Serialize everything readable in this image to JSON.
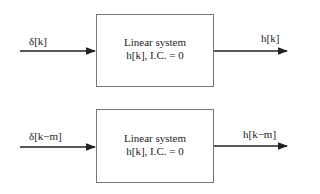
{
  "diagrams": [
    {
      "input_label": "δ[k]",
      "box_line1": "Linear system",
      "box_line2": "h[k], I.C. = 0",
      "output_label": "h[k]"
    },
    {
      "input_label": "δ[k−m]",
      "box_line1": "Linear system",
      "box_line2": "h[k], I.C. = 0",
      "output_label": "h[k−m]"
    }
  ]
}
